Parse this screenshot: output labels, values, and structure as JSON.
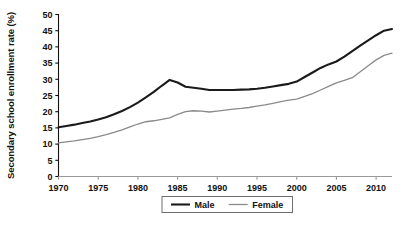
{
  "chart_data": {
    "type": "line",
    "title": "",
    "xlabel": "",
    "ylabel": "Secondary school enrollment rate (%)",
    "xlim": [
      1970,
      2012
    ],
    "ylim": [
      0,
      50
    ],
    "grid": false,
    "legend_position": "bottom-center",
    "x_ticks": [
      "1970",
      "1975",
      "1980",
      "1985",
      "1990",
      "1995",
      "2000",
      "2005",
      "2010"
    ],
    "x_tick_values": [
      1970,
      1975,
      1980,
      1985,
      1990,
      1995,
      2000,
      2005,
      2010
    ],
    "y_ticks": [
      "0",
      "5",
      "10",
      "15",
      "20",
      "25",
      "30",
      "35",
      "40",
      "45",
      "50"
    ],
    "y_tick_values": [
      0,
      5,
      10,
      15,
      20,
      25,
      30,
      35,
      40,
      45,
      50
    ],
    "x": [
      1970,
      1971,
      1972,
      1973,
      1974,
      1975,
      1976,
      1977,
      1978,
      1979,
      1980,
      1981,
      1982,
      1983,
      1984,
      1985,
      1986,
      1987,
      1988,
      1989,
      1990,
      1991,
      1992,
      1993,
      1994,
      1995,
      1996,
      1997,
      1998,
      1999,
      2000,
      2001,
      2002,
      2003,
      2004,
      2005,
      2006,
      2007,
      2008,
      2009,
      2010,
      2011,
      2012
    ],
    "series": [
      {
        "name": "Male",
        "color": "#1a1a1a",
        "line_width": 2.1,
        "values": [
          15.2,
          15.6,
          16.0,
          16.5,
          17.0,
          17.6,
          18.3,
          19.2,
          20.2,
          21.4,
          22.8,
          24.4,
          26.1,
          28.0,
          29.8,
          29.0,
          27.7,
          27.4,
          27.1,
          26.7,
          26.7,
          26.7,
          26.7,
          26.8,
          26.9,
          27.1,
          27.4,
          27.8,
          28.2,
          28.6,
          29.3,
          30.7,
          32.1,
          33.5,
          34.6,
          35.5,
          37.0,
          38.7,
          40.4,
          42.0,
          43.6,
          45.0,
          45.5
        ]
      },
      {
        "name": "Female",
        "color": "#8a8a8a",
        "line_width": 1.3,
        "values": [
          10.4,
          10.7,
          11.0,
          11.4,
          11.8,
          12.3,
          12.9,
          13.6,
          14.4,
          15.3,
          16.2,
          16.9,
          17.2,
          17.6,
          18.1,
          19.2,
          20.0,
          20.3,
          20.2,
          19.9,
          20.2,
          20.5,
          20.8,
          21.0,
          21.3,
          21.7,
          22.1,
          22.6,
          23.1,
          23.6,
          23.9,
          24.7,
          25.6,
          26.7,
          27.8,
          28.9,
          29.7,
          30.5,
          32.3,
          34.2,
          36.0,
          37.4,
          38.1
        ]
      }
    ]
  },
  "legend": {
    "items": [
      {
        "label": "Male",
        "color": "#1a1a1a"
      },
      {
        "label": "Female",
        "color": "#8a8a8a"
      }
    ]
  },
  "axes": {
    "y_axis_title": "Secondary school enrollment rate (%)"
  }
}
